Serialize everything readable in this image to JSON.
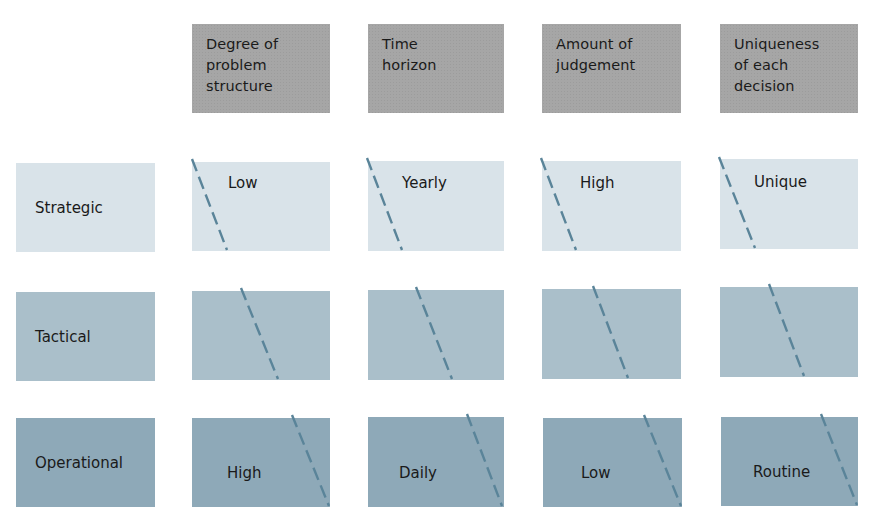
{
  "colors": {
    "header_fill": "#a6a6a6",
    "strategic_fill": "#d9e3e9",
    "tactical_fill": "#aabfca",
    "operational_fill": "#8ea9b8",
    "dash_line": "#5a8499",
    "text": "#1a1a1a"
  },
  "columns": [
    {
      "label_lines": [
        "Degree of",
        "problem",
        "structure"
      ]
    },
    {
      "label_lines": [
        "Time",
        "horizon"
      ]
    },
    {
      "label_lines": [
        "Amount of",
        "judgement"
      ]
    },
    {
      "label_lines": [
        "Uniqueness",
        "of each",
        "decision"
      ]
    }
  ],
  "rows": [
    {
      "label": "Strategic",
      "values": [
        "Low",
        "Yearly",
        "High",
        "Unique"
      ]
    },
    {
      "label": "Tactical",
      "values": [
        "",
        "",
        "",
        ""
      ]
    },
    {
      "label": "Operational",
      "values": [
        "High",
        "Daily",
        "Low",
        "Routine"
      ]
    }
  ],
  "diagram": {
    "type": "matrix"
  }
}
